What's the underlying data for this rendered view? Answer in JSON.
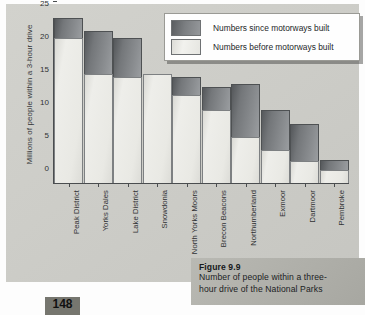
{
  "page": {
    "page_number": "148"
  },
  "figure": {
    "caption_title": "Figure 9.9",
    "caption_line1": "Number of people within a three-",
    "caption_line2": "hour drive of the National Parks"
  },
  "legend": {
    "position": "top-right",
    "items": [
      {
        "label": "Numbers since motorways built",
        "color": "#74777a",
        "key": "since"
      },
      {
        "label": "Numbers before motorways built",
        "color": "#e9e9e4",
        "key": "before"
      }
    ]
  },
  "axes": {
    "ylabel": "Millions of people within a 3-hour drive",
    "yticks": [
      "0",
      "5",
      "10",
      "15",
      "20",
      "25"
    ]
  },
  "chart_data": {
    "type": "bar",
    "subtype": "stacked-vertical",
    "xlabel": "",
    "ylabel": "Millions of people within a 3-hour drive",
    "ylim": [
      0,
      25
    ],
    "yticks": [
      0,
      5,
      10,
      15,
      20,
      25
    ],
    "grid": false,
    "legend_position": "top-right",
    "categories": [
      "Peak District",
      "Yorks Dales",
      "Lake District",
      "Snowdonia",
      "North Yorks Moors",
      "Brecon Beacons",
      "Northumberland",
      "Exmoor",
      "Dartmoor",
      "Pembroke"
    ],
    "series": [
      {
        "name": "Numbers before motorways built",
        "color": "#e9e9e4",
        "values": [
          22,
          16.5,
          16,
          16.5,
          13.3,
          11,
          7,
          5,
          3.3,
          2
        ]
      },
      {
        "name": "Numbers since motorways built",
        "color": "#74777a",
        "note": "stacked increment above the 'before' value",
        "values": [
          3,
          6.5,
          6,
          0,
          2.7,
          3.5,
          8,
          6,
          5.7,
          1.5
        ]
      }
    ],
    "totals": [
      25,
      23,
      22,
      16.5,
      16,
      14.5,
      15,
      11,
      9,
      3.5
    ]
  }
}
